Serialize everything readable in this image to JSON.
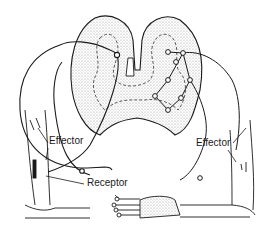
{
  "diagram": {
    "labels": {
      "effector_left": "Effector",
      "effector_right": "Effector",
      "receptor": "Receptor"
    },
    "colors": {
      "ink": "#1a1a1a",
      "gray_matter_fill": "#e4e4e4",
      "background": "#ffffff"
    }
  }
}
